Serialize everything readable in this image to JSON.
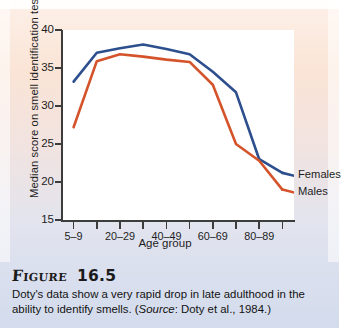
{
  "figure": {
    "label": "Figure",
    "number": "16.5",
    "caption_part1": "Doty's data show a very rapid drop in late adulthood in the ability to identify smells. (",
    "caption_source_word": "Source",
    "caption_part2": ": Doty et al., 1984.)"
  },
  "legend": {
    "females": "Females",
    "males": "Males"
  },
  "colors": {
    "females": "#2d4f8e",
    "males": "#d4532b",
    "axis": "#3c3c3c",
    "plot_bg": "#ffffff"
  },
  "chart_data": {
    "type": "line",
    "title": "",
    "xlabel": "Age group",
    "ylabel": "Median score on smell identification test",
    "ylim": [
      15,
      40
    ],
    "yticks": [
      15,
      20,
      25,
      30,
      35,
      40
    ],
    "ytick_labels": [
      "15",
      "20",
      "25",
      "30",
      "35",
      "40"
    ],
    "grid": false,
    "legend_position": "right-inside",
    "categories": [
      "5–9",
      "10–19",
      "20–29",
      "30–39",
      "40–49",
      "50–59",
      "60–69",
      "70–79",
      "80–89",
      "90–99"
    ],
    "xtick_labels_shown": [
      "5–9",
      "",
      "20–29",
      "",
      "40–49",
      "",
      "60–69",
      "",
      "80–89",
      ""
    ],
    "series": [
      {
        "name": "Females",
        "color": "#2d4f8e",
        "values": [
          33.2,
          37.0,
          37.6,
          38.1,
          37.5,
          36.8,
          34.5,
          31.8,
          23.0,
          21.2
        ]
      },
      {
        "name": "Males",
        "color": "#d4532b",
        "values": [
          27.2,
          35.9,
          36.8,
          36.5,
          36.1,
          35.8,
          32.8,
          25.0,
          22.8,
          19.0
        ]
      }
    ]
  }
}
